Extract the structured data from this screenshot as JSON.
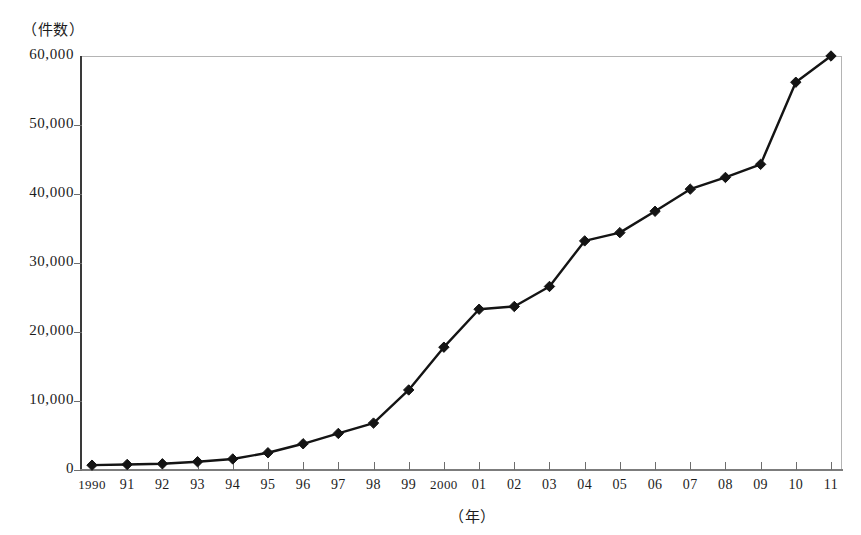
{
  "chart_data": {
    "type": "line",
    "title": "",
    "subtitle": "",
    "xlabel": "（年）",
    "ylabel": "（件数）",
    "categories": [
      "1990",
      "91",
      "92",
      "93",
      "94",
      "95",
      "96",
      "97",
      "98",
      "99",
      "2000",
      "01",
      "02",
      "03",
      "04",
      "05",
      "06",
      "07",
      "08",
      "09",
      "10",
      "11"
    ],
    "x": [
      1990,
      1991,
      1992,
      1993,
      1994,
      1995,
      1996,
      1997,
      1998,
      1999,
      2000,
      2001,
      2002,
      2003,
      2004,
      2005,
      2006,
      2007,
      2008,
      2009,
      2010,
      2011
    ],
    "values": [
      700,
      800,
      900,
      1200,
      1600,
      2500,
      3800,
      5300,
      6800,
      11600,
      17800,
      23300,
      23700,
      26600,
      33200,
      34400,
      37500,
      40700,
      42400,
      44300,
      56200,
      60000
    ],
    "series": [
      {
        "name": "件数",
        "values": [
          700,
          800,
          900,
          1200,
          1600,
          2500,
          3800,
          5300,
          6800,
          11600,
          17800,
          23300,
          23700,
          26600,
          33200,
          34400,
          37500,
          40700,
          42400,
          44300,
          56200,
          60000
        ]
      }
    ],
    "ylim": [
      0,
      60000
    ],
    "yticks": [
      0,
      10000,
      20000,
      30000,
      40000,
      50000,
      60000
    ],
    "ytick_labels": [
      "0",
      "10,000",
      "20,000",
      "30,000",
      "40,000",
      "50,000",
      "60,000"
    ],
    "grid": false,
    "legend": "none",
    "marker": "diamond",
    "line_color": "#141414",
    "frame_color": "#9a9a9a"
  }
}
